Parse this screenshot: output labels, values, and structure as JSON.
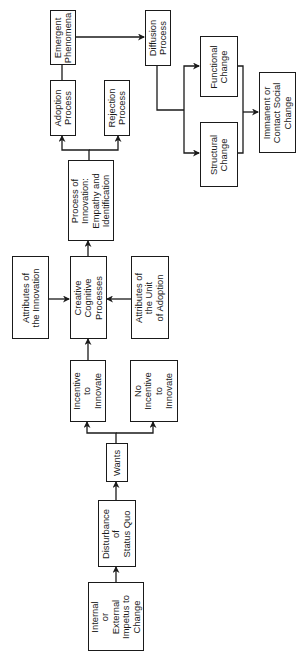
{
  "diagram": {
    "orientation": "rotated-90-ccw",
    "nodes": [
      {
        "id": "impetus",
        "label": "Internal\nor\nExternal\nImpetus to\nChange"
      },
      {
        "id": "disturbance",
        "label": "Disturbance\nof\nStatus Quo"
      },
      {
        "id": "wants",
        "label": "Wants"
      },
      {
        "id": "incentive",
        "label": "Incentive\nto\nInnovate"
      },
      {
        "id": "no_incentive",
        "label": "No\nIncentive\nto\nInnovate"
      },
      {
        "id": "attr_innovation",
        "label": "Attributes of\nthe Innovation"
      },
      {
        "id": "creative",
        "label": "Creative\nCognitive\nProcesses"
      },
      {
        "id": "attr_unit",
        "label": "Attributes of\nthe Unit\nof Adoption"
      },
      {
        "id": "process_innovation",
        "label": "Process of\nInnovation:\nEmpathy and\nIdentification"
      },
      {
        "id": "adoption",
        "label": "Adoption\nProcess"
      },
      {
        "id": "rejection",
        "label": "Rejection\nProcess"
      },
      {
        "id": "emergent",
        "label": "Emergent\nPhenomena"
      },
      {
        "id": "diffusion",
        "label": "Diffusion\nProcess"
      },
      {
        "id": "functional",
        "label": "Functional\nChange"
      },
      {
        "id": "structural",
        "label": "Structural\nChange"
      },
      {
        "id": "immanent",
        "label": "Immanent or\nContact Social\nChange"
      }
    ],
    "edges": [
      {
        "from": "impetus",
        "to": "disturbance"
      },
      {
        "from": "disturbance",
        "to": "wants"
      },
      {
        "from": "wants",
        "to": "incentive"
      },
      {
        "from": "wants",
        "to": "no_incentive"
      },
      {
        "from": "incentive",
        "to": "creative"
      },
      {
        "from": "attr_innovation",
        "to": "creative"
      },
      {
        "from": "attr_unit",
        "to": "creative"
      },
      {
        "from": "creative",
        "to": "process_innovation"
      },
      {
        "from": "process_innovation",
        "to": "adoption"
      },
      {
        "from": "process_innovation",
        "to": "rejection"
      },
      {
        "from": "adoption",
        "to": "emergent"
      },
      {
        "from": "emergent",
        "to": "diffusion"
      },
      {
        "from": "diffusion",
        "to": "functional"
      },
      {
        "from": "diffusion",
        "to": "structural"
      },
      {
        "from": "functional",
        "to": "immanent"
      },
      {
        "from": "structural",
        "to": "immanent"
      }
    ]
  }
}
